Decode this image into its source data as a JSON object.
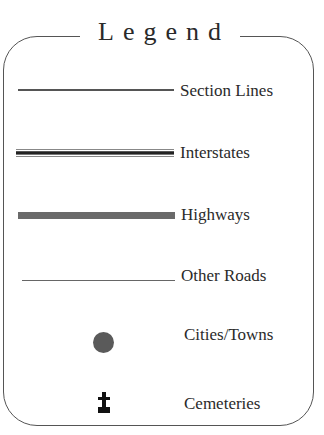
{
  "legend": {
    "title": "Legend",
    "items": [
      {
        "label": "Section Lines",
        "symbol": "thin-double-line",
        "color": "#555555"
      },
      {
        "label": "Interstates",
        "symbol": "multi-stripe-line",
        "color": "#222222"
      },
      {
        "label": "Highways",
        "symbol": "thick-gray-bar",
        "color": "#6a6a6a"
      },
      {
        "label": "Other Roads",
        "symbol": "hairline",
        "color": "#666666"
      },
      {
        "label": "Cities/Towns",
        "symbol": "filled-circle",
        "color": "#5a5a5a"
      },
      {
        "label": "Cemeteries",
        "symbol": "grave-cross",
        "color": "#111111"
      }
    ]
  }
}
